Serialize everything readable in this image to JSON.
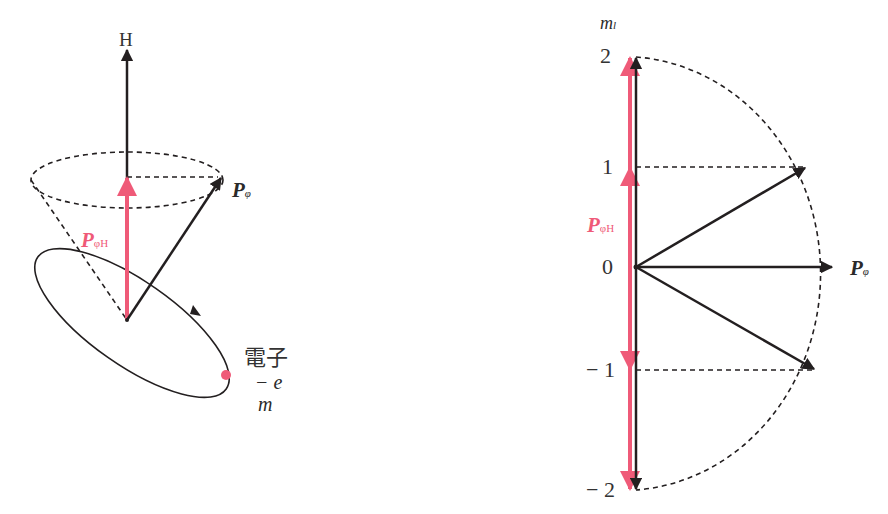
{
  "colors": {
    "ink": "#231f20",
    "accent_pink": "#ef5a78",
    "background": "#ffffff"
  },
  "left_diagram": {
    "field_label": "H",
    "momentum_label": {
      "main": "P",
      "sub": "φ"
    },
    "projection_label": {
      "main": "P",
      "sub": "φH"
    },
    "electron_label": "電子",
    "charge_label": "− e",
    "mass_label": "m"
  },
  "right_diagram": {
    "axis_label": {
      "main": "m",
      "sub": "l"
    },
    "ticks": [
      "2",
      "1",
      "0",
      "− 1",
      "− 2"
    ],
    "tick_values": [
      2,
      1,
      0,
      -1,
      -2
    ],
    "momentum_label": {
      "main": "P",
      "sub": "φ"
    },
    "projection_label": {
      "main": "P",
      "sub": "φH"
    }
  }
}
